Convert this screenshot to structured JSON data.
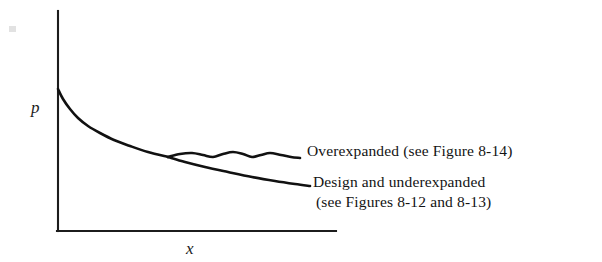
{
  "figure": {
    "axes": {
      "y_label": "p",
      "x_label": "x"
    },
    "annotations": {
      "overexpanded": "Overexpanded (see Figure 8-14)",
      "design_line1": "Design and underexpanded",
      "design_line2": "(see Figures 8-12 and 8-13)"
    },
    "colors": {
      "ink": "#111111",
      "background": "#ffffff"
    }
  },
  "chart_data": {
    "type": "line",
    "title": "",
    "xlabel": "x",
    "ylabel": "p",
    "grid": false,
    "legend": "inline-end-labels",
    "axis_style": "L-shaped open axes, no tick marks, no numeric scale",
    "axis_pixel_geometry": {
      "y_axis_x": 58,
      "y_axis_top_y": 11,
      "x_axis_y": 231,
      "x_axis_right_x": 336
    },
    "series": [
      {
        "name": "Common inlet expansion (shared nozzle segment)",
        "role": "shared",
        "points": [
          [
            58,
            89
          ],
          [
            63,
            99
          ],
          [
            70,
            109
          ],
          [
            78,
            118
          ],
          [
            88,
            126
          ],
          [
            100,
            133
          ],
          [
            114,
            140
          ],
          [
            130,
            146
          ],
          [
            148,
            152
          ],
          [
            168,
            157
          ]
        ]
      },
      {
        "name": "Overexpanded (see Figure 8-14)",
        "role": "overexpanded",
        "description": "Branch with shock-diamond oscillations that level off downstream",
        "points": [
          [
            168,
            157
          ],
          [
            180,
            154
          ],
          [
            192,
            153
          ],
          [
            203,
            155
          ],
          [
            213,
            157
          ],
          [
            223,
            154
          ],
          [
            233,
            152
          ],
          [
            243,
            154
          ],
          [
            252,
            157
          ],
          [
            261,
            155
          ],
          [
            270,
            153
          ],
          [
            281,
            155
          ],
          [
            291,
            157
          ],
          [
            300,
            158
          ]
        ]
      },
      {
        "name": "Design and underexpanded (see Figures 8-12 and 8-13)",
        "role": "design-underexpanded",
        "description": "Smooth monotonically decreasing branch",
        "points": [
          [
            168,
            157
          ],
          [
            185,
            162
          ],
          [
            205,
            167
          ],
          [
            228,
            172
          ],
          [
            252,
            177
          ],
          [
            275,
            181
          ],
          [
            295,
            184
          ],
          [
            310,
            186
          ]
        ]
      }
    ]
  }
}
